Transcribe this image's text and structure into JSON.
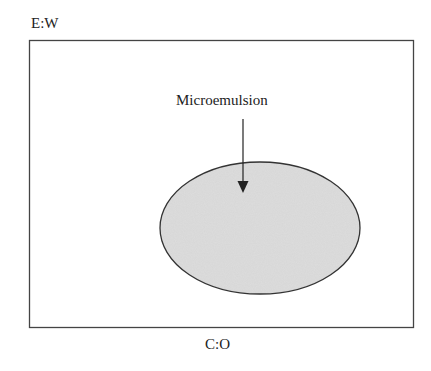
{
  "diagram": {
    "top_axis_label": "E:W",
    "bottom_axis_label": "C:O",
    "region_label": "Microemulsion",
    "colors": {
      "frame": "#444444",
      "region_fill": "#d6d6d6",
      "region_stroke": "#333333",
      "arrow": "#222222"
    }
  }
}
